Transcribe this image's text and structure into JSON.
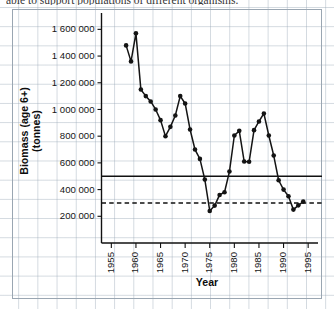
{
  "caption": {
    "cropped_line": "able to support populations of different organisms."
  },
  "chart_data": {
    "type": "line",
    "title": "",
    "xlabel": "Year",
    "ylabel": "Biomass (age 6+) (tonnes)",
    "ylabel_line1": "Biomass (age 6+)",
    "ylabel_line2": "(tonnes)",
    "xlim": [
      1953,
      1997
    ],
    "ylim": [
      0,
      1700000
    ],
    "grid": true,
    "legend": "none",
    "x_ticks": [
      1955,
      1960,
      1965,
      1970,
      1975,
      1980,
      1985,
      1990,
      1995
    ],
    "x_tick_labels": [
      "1955",
      "1960",
      "1965",
      "1970",
      "1975",
      "1980",
      "1985",
      "1990",
      "1995"
    ],
    "y_ticks": [
      200000,
      400000,
      600000,
      800000,
      1000000,
      1200000,
      1400000,
      1600000
    ],
    "y_tick_labels": [
      "200 000",
      "400 000",
      "600 000",
      "800 000",
      "1 000 000",
      "1 200 000",
      "1 400 000",
      "1 600 000"
    ],
    "reference_lines": [
      {
        "name": "upper-threshold",
        "value": 500000,
        "style": "solid",
        "label": ""
      },
      {
        "name": "lower-threshold",
        "value": 300000,
        "style": "dashed",
        "label": ""
      }
    ],
    "series": [
      {
        "name": "Biomass (age 6+)",
        "marker": "circle",
        "color": "#141414",
        "x": [
          1958,
          1959,
          1960,
          1961,
          1962,
          1963,
          1964,
          1965,
          1966,
          1967,
          1968,
          1969,
          1970,
          1971,
          1972,
          1973,
          1974,
          1975,
          1976,
          1977,
          1978,
          1979,
          1980,
          1981,
          1982,
          1983,
          1984,
          1985,
          1986,
          1987,
          1988,
          1989,
          1990,
          1991,
          1992,
          1993,
          1994
        ],
        "values": [
          1480000,
          1360000,
          1570000,
          1150000,
          1100000,
          1060000,
          1000000,
          920000,
          800000,
          870000,
          955000,
          1100000,
          1045000,
          850000,
          700000,
          630000,
          475000,
          240000,
          280000,
          360000,
          380000,
          535000,
          805000,
          840000,
          610000,
          608000,
          845000,
          910000,
          970000,
          805000,
          655000,
          470000,
          400000,
          350000,
          250000,
          282000,
          310000
        ]
      }
    ]
  }
}
